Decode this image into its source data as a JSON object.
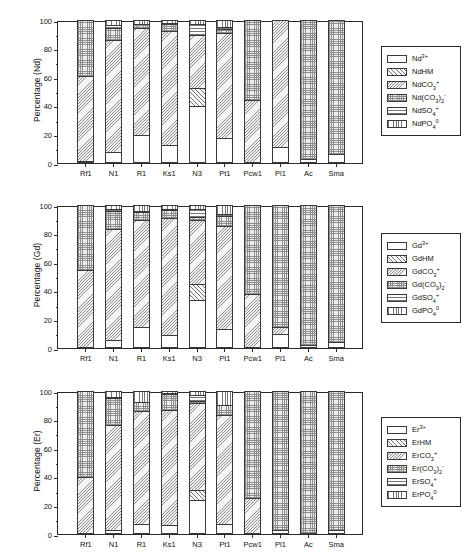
{
  "figure": {
    "type": "stacked-bar-panels",
    "panel_count": 3,
    "categories": [
      "Rf1",
      "N1",
      "R1",
      "Ks1",
      "N3",
      "Pt1",
      "Pcw1",
      "Pl1",
      "Ac",
      "Sma"
    ],
    "ylim": [
      0,
      100
    ],
    "yticks": [
      0,
      20,
      40,
      60,
      80,
      100
    ],
    "ytick_labels": [
      "0",
      "20",
      "40",
      "60",
      "80",
      "100"
    ]
  },
  "panels": [
    {
      "id": "Nd",
      "ylabel": "Percentage (Nd)",
      "element": "Nd",
      "legend": [
        {
          "key": "free",
          "label_html": "Nd<sup>3+</sup>",
          "label": "Nd3+",
          "pattern": "p-free"
        },
        {
          "key": "hm",
          "label_html": "NdHM",
          "label": "NdHM",
          "pattern": "p-hm"
        },
        {
          "key": "co3",
          "label_html": "NdCO<sub>3</sub><sup>+</sup>",
          "label": "NdCO3+",
          "pattern": "p-co3"
        },
        {
          "key": "co32",
          "label_html": "Nd(CO<sub>3</sub>)<sub>2</sub><sup>-</sup>",
          "label": "Nd(CO3)2-",
          "pattern": "p-co32"
        },
        {
          "key": "so4",
          "label_html": "NdSO<sub>4</sub><sup>+</sup>",
          "label": "NdSO4+",
          "pattern": "p-so4"
        },
        {
          "key": "po4",
          "label_html": "NdPO<sub>4</sub><sup>0</sup>",
          "label": "NdPO4 0",
          "pattern": "p-po4"
        }
      ],
      "series": [
        {
          "name": "Nd3+",
          "values": [
            1.5,
            8.0,
            19.5,
            12.5,
            40.0,
            17.5,
            0.6,
            11.0,
            3.0,
            6.0
          ]
        },
        {
          "name": "NdHM",
          "values": [
            0.0,
            0.0,
            0.0,
            0.0,
            12.5,
            0.0,
            0.0,
            0.0,
            0.0,
            0.0
          ]
        },
        {
          "name": "NdCO3+",
          "values": [
            59.5,
            78.0,
            75.0,
            79.5,
            37.0,
            73.5,
            43.5,
            89.0,
            0.0,
            0.0
          ]
        },
        {
          "name": "Nd(CO3)2-",
          "values": [
            39.0,
            8.5,
            2.5,
            5.0,
            0.0,
            2.5,
            55.9,
            0.0,
            97.0,
            94.0
          ]
        },
        {
          "name": "NdSO4+",
          "values": [
            0.0,
            2.0,
            0.5,
            1.0,
            8.0,
            1.5,
            0.0,
            0.0,
            0.0,
            0.0
          ]
        },
        {
          "name": "NdPO4 0",
          "values": [
            0.0,
            3.5,
            2.5,
            2.0,
            2.5,
            5.0,
            0.0,
            0.0,
            0.0,
            0.0
          ]
        }
      ]
    },
    {
      "id": "Gd",
      "ylabel": "Percentage (Gd)",
      "element": "Gd",
      "legend": [
        {
          "key": "free",
          "label_html": "Gd<sup>3+</sup>",
          "label": "Gd3+",
          "pattern": "p-free"
        },
        {
          "key": "hm",
          "label_html": "GdHM",
          "label": "GdHM",
          "pattern": "p-hm"
        },
        {
          "key": "co3",
          "label_html": "GdCO<sub>3</sub><sup>+</sup>",
          "label": "GdCO3+",
          "pattern": "p-co3"
        },
        {
          "key": "co32",
          "label_html": "Gd(CO<sub>3</sub>)<sub>2</sub><sup>-</sup>",
          "label": "Gd(CO3)2-",
          "pattern": "p-co32"
        },
        {
          "key": "so4",
          "label_html": "GdSO<sub>4</sub><sup>+</sup>",
          "label": "GdSO4+",
          "pattern": "p-so4"
        },
        {
          "key": "po4",
          "label_html": "GdPO<sub>4</sub><sup>0</sup>",
          "label": "GdPO4 0",
          "pattern": "p-po4"
        }
      ],
      "series": [
        {
          "name": "Gd3+",
          "values": [
            1.0,
            5.5,
            14.5,
            9.0,
            33.5,
            13.0,
            0.5,
            9.5,
            2.0,
            4.5
          ]
        },
        {
          "name": "GdHM",
          "values": [
            0.0,
            0.0,
            0.0,
            0.0,
            11.5,
            0.0,
            0.0,
            0.0,
            0.0,
            0.0
          ]
        },
        {
          "name": "GdCO3+",
          "values": [
            53.5,
            78.0,
            75.0,
            82.0,
            44.5,
            72.5,
            37.0,
            5.5,
            0.0,
            0.0
          ]
        },
        {
          "name": "Gd(CO3)2-",
          "values": [
            45.5,
            12.5,
            5.5,
            5.5,
            2.0,
            7.0,
            62.5,
            85.0,
            98.0,
            95.5
          ]
        },
        {
          "name": "GdSO4+",
          "values": [
            0.0,
            1.5,
            0.5,
            0.5,
            5.5,
            1.0,
            0.0,
            0.0,
            0.0,
            0.0
          ]
        },
        {
          "name": "GdPO4 0",
          "values": [
            0.0,
            2.5,
            4.5,
            3.0,
            3.0,
            6.5,
            0.0,
            0.0,
            0.0,
            0.0
          ]
        }
      ]
    },
    {
      "id": "Er",
      "ylabel": "Percentage (Er)",
      "element": "Er",
      "legend": [
        {
          "key": "free",
          "label_html": "Er<sup>3+</sup>",
          "label": "Er3+",
          "pattern": "p-free"
        },
        {
          "key": "hm",
          "label_html": "ErHM",
          "label": "ErHM",
          "pattern": "p-hm"
        },
        {
          "key": "co3",
          "label_html": "ErCO<sub>3</sub><sup>+</sup>",
          "label": "ErCO3+",
          "pattern": "p-co3"
        },
        {
          "key": "co32",
          "label_html": "Er(CO<sub>3</sub>)<sub>2</sub><sup>-</sup>",
          "label": "Er(CO3)2-",
          "pattern": "p-co32"
        },
        {
          "key": "so4",
          "label_html": "ErSO<sub>4</sub><sup>+</sup>",
          "label": "ErSO4+",
          "pattern": "p-so4"
        },
        {
          "key": "po4",
          "label_html": "ErPO<sub>4</sub><sup>0</sup>",
          "label": "ErPO4 0",
          "pattern": "p-po4"
        }
      ],
      "series": [
        {
          "name": "Er3+",
          "values": [
            0.5,
            2.5,
            7.0,
            6.0,
            23.5,
            7.0,
            0.4,
            3.0,
            1.0,
            3.0
          ]
        },
        {
          "name": "ErHM",
          "values": [
            0.0,
            0.0,
            0.0,
            0.0,
            7.0,
            0.0,
            0.0,
            0.0,
            0.0,
            0.0
          ]
        },
        {
          "name": "ErCO3+",
          "values": [
            39.5,
            74.0,
            79.0,
            80.5,
            61.0,
            76.5,
            25.0,
            0.0,
            0.0,
            0.0
          ]
        },
        {
          "name": "Er(CO3)2-",
          "values": [
            60.0,
            18.5,
            6.0,
            11.5,
            1.5,
            6.5,
            74.6,
            97.0,
            99.0,
            97.0
          ]
        },
        {
          "name": "ErSO4+",
          "values": [
            0.0,
            0.5,
            0.3,
            0.3,
            4.5,
            0.5,
            0.0,
            0.0,
            0.0,
            0.0
          ]
        },
        {
          "name": "ErPO4 0",
          "values": [
            0.0,
            4.5,
            7.7,
            1.7,
            2.5,
            9.5,
            0.0,
            0.0,
            0.0,
            0.0
          ]
        }
      ]
    }
  ]
}
